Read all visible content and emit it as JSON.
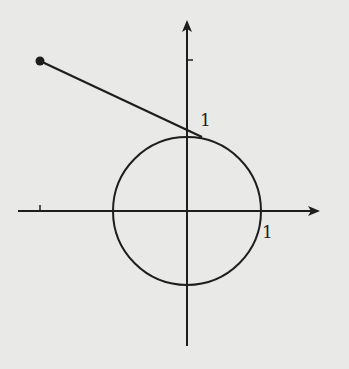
{
  "diagram": {
    "labels": {
      "y_axis_one": "1",
      "x_axis_one": "1"
    },
    "colors": {
      "background": "#e9e9e7",
      "ink": "#1e1e1e"
    },
    "geometry": {
      "origin_px": [
        187,
        211
      ],
      "circle_radius_px": 74,
      "external_point_px": [
        40,
        61
      ],
      "tangent_point_px": [
        200,
        136
      ],
      "y_axis_tick_px": [
        187,
        60
      ],
      "x_axis_tick_px": [
        40,
        211
      ]
    }
  }
}
